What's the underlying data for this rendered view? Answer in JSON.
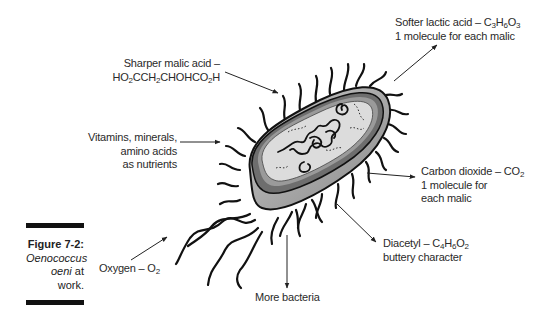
{
  "figure": {
    "number": "Figure 7-2:",
    "caption_italic_1": "Oenococcus",
    "caption_italic_2": "oeni",
    "caption_rest_1": " at",
    "caption_rest_2": "work."
  },
  "labels": {
    "malic": {
      "line1": "Sharper malic acid –",
      "formula": [
        "HO",
        "2",
        "CCH",
        "2",
        "CHOHCO",
        "2",
        "H"
      ]
    },
    "nutrients": {
      "line1": "Vitamins, minerals,",
      "line2": "amino acids",
      "line3": "as nutrients"
    },
    "oxygen": {
      "text": "Oxygen – O",
      "sub": "2"
    },
    "more_bacteria": {
      "text": "More bacteria"
    },
    "diacetyl": {
      "text": "Diacetyl – C",
      "formula": [
        "4",
        "H",
        "6",
        "O",
        "2"
      ],
      "line2": "buttery character"
    },
    "co2": {
      "text": "Carbon dioxide – CO",
      "sub": "2",
      "line2": "1 molecule for",
      "line3": "each malic"
    },
    "lactic": {
      "text": "Softer lactic acid – C",
      "formula": [
        "3",
        "H",
        "6",
        "O",
        "3"
      ],
      "line2": "1 molecule for each malic"
    }
  },
  "colors": {
    "outline": "#111111",
    "membrane_outer": "#6e6e6e",
    "membrane_inner": "#9a9a9a",
    "cytoplasm": "#dcdcdc",
    "shadow_body": "#a8a8a8"
  }
}
